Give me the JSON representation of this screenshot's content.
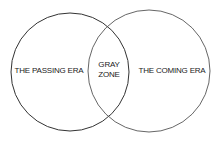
{
  "diagram": {
    "type": "venn",
    "circles": [
      {
        "id": "left",
        "label": "THE PASSING ERA",
        "cx": 70,
        "cy": 72,
        "r": 59,
        "stroke": "#333333"
      },
      {
        "id": "right",
        "label": "THE COMING ERA",
        "cx": 149,
        "cy": 71,
        "r": 61,
        "stroke": "#555555"
      }
    ],
    "intersection": {
      "line1": "GRAY",
      "line2": "ZONE"
    }
  }
}
